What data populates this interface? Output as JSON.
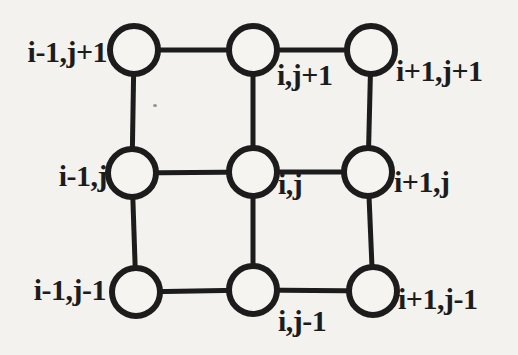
{
  "figure": {
    "colors": {
      "background": "#f3f2ee",
      "ink": "#1c1c1c",
      "node_fill": "#f5f4f0"
    },
    "canvas": {
      "width": 518,
      "height": 355
    },
    "style": {
      "node_radius": 24,
      "node_stroke_width": 6,
      "edge_stroke_width": 5,
      "label_font_size": 30
    },
    "nodes": [
      {
        "id": "i-1,j+1",
        "label": "i-1,j+1",
        "cx": 134,
        "cy": 50,
        "label_x": 107,
        "label_y": 62,
        "anchor": "end"
      },
      {
        "id": "i,j+1",
        "label": "i,j+1",
        "cx": 253,
        "cy": 50,
        "label_x": 277,
        "label_y": 85,
        "anchor": "start"
      },
      {
        "id": "i+1,j+1",
        "label": "i+1,j+1",
        "cx": 371,
        "cy": 50,
        "label_x": 396,
        "label_y": 81,
        "anchor": "start"
      },
      {
        "id": "i-1,j",
        "label": "i-1,j",
        "cx": 132,
        "cy": 173,
        "label_x": 107,
        "label_y": 186,
        "anchor": "end"
      },
      {
        "id": "i,j",
        "label": "i,j",
        "cx": 253,
        "cy": 172,
        "label_x": 278,
        "label_y": 194,
        "anchor": "start"
      },
      {
        "id": "i+1,j",
        "label": "i+1,j",
        "cx": 368,
        "cy": 172,
        "label_x": 394,
        "label_y": 192,
        "anchor": "start"
      },
      {
        "id": "i-1,j-1",
        "label": "i-1,j-1",
        "cx": 136,
        "cy": 292,
        "label_x": 106,
        "label_y": 300,
        "anchor": "end"
      },
      {
        "id": "i,j-1",
        "label": "i,j-1",
        "cx": 253,
        "cy": 290,
        "label_x": 278,
        "label_y": 331,
        "anchor": "start"
      },
      {
        "id": "i+1,j-1",
        "label": "i+1,j-1",
        "cx": 373,
        "cy": 291,
        "label_x": 398,
        "label_y": 309,
        "anchor": "start"
      }
    ],
    "edges": [
      [
        0,
        1
      ],
      [
        1,
        2
      ],
      [
        3,
        4
      ],
      [
        4,
        5
      ],
      [
        6,
        7
      ],
      [
        7,
        8
      ],
      [
        0,
        3
      ],
      [
        3,
        6
      ],
      [
        1,
        4
      ],
      [
        4,
        7
      ],
      [
        2,
        5
      ],
      [
        5,
        8
      ]
    ]
  }
}
